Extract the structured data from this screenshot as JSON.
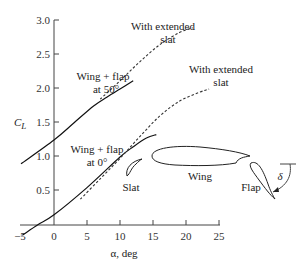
{
  "chart_data": {
    "type": "line",
    "title": "",
    "xlabel": "α, deg",
    "ylabel": "C_L",
    "xlim": [
      -5,
      25
    ],
    "ylim": [
      0,
      3.0
    ],
    "x_ticks": [
      -5,
      0,
      5,
      10,
      15,
      20,
      25
    ],
    "y_ticks": [
      0.5,
      1.0,
      1.5,
      2.0,
      2.5,
      3.0
    ],
    "x_tick_labels": [
      "−5",
      "0",
      "5",
      "10",
      "15",
      "20",
      "25"
    ],
    "y_tick_labels": [
      "0.5",
      "1.0",
      "1.5",
      "2.0",
      "2.5",
      "3.0"
    ],
    "grid": false,
    "series": [
      {
        "name": "Wing + flap at 0°",
        "style": "solid",
        "points": [
          [
            -4.8,
            -0.15
          ],
          [
            -2.5,
            0.0
          ],
          [
            0,
            0.15
          ],
          [
            5,
            0.55
          ],
          [
            10,
            1.0
          ],
          [
            12,
            1.15
          ],
          [
            14,
            1.28
          ],
          [
            15.5,
            1.33
          ]
        ]
      },
      {
        "name": "Wing + flap at 0°, with extended slat",
        "style": "dashed",
        "points": [
          [
            4,
            0.38
          ],
          [
            7,
            0.68
          ],
          [
            10,
            0.98
          ],
          [
            13,
            1.3
          ],
          [
            16,
            1.6
          ],
          [
            19,
            1.82
          ],
          [
            22,
            1.95
          ],
          [
            23.5,
            2.0
          ]
        ]
      },
      {
        "name": "Wing + flap at 50°",
        "style": "solid",
        "points": [
          [
            -5,
            0.9
          ],
          [
            0,
            1.25
          ],
          [
            3,
            1.5
          ],
          [
            6,
            1.75
          ],
          [
            8,
            1.88
          ],
          [
            10,
            2.0
          ],
          [
            12,
            2.12
          ]
        ]
      },
      {
        "name": "Wing + flap at 50°, with extended slat",
        "style": "dashed",
        "points": [
          [
            7,
            1.85
          ],
          [
            10,
            2.12
          ],
          [
            13,
            2.4
          ],
          [
            16,
            2.65
          ],
          [
            19,
            2.83
          ],
          [
            21,
            2.9
          ]
        ]
      }
    ],
    "annotations": [
      {
        "text": "With extended slat",
        "near": "upper dashed curve"
      },
      {
        "text": "Wing + flap at 50°",
        "near": "upper solid curve"
      },
      {
        "text": "With extended slat",
        "near": "lower dashed curve"
      },
      {
        "text": "Wing + flap at 0°",
        "near": "lower solid curve"
      },
      {
        "text": "Slat",
        "near": "airfoil sketch"
      },
      {
        "text": "Wing",
        "near": "airfoil sketch"
      },
      {
        "text": "Flap",
        "near": "airfoil sketch"
      },
      {
        "text": "δ",
        "near": "flap deflection angle"
      }
    ]
  },
  "labels": {
    "ylabel": "C",
    "ylabel_sub": "L",
    "xlabel": "α, deg",
    "slat_upper_1": "With extended",
    "slat_upper_2": "slat",
    "slat_lower_1": "With extended",
    "slat_lower_2": "slat",
    "flap50_1": "Wing + flap",
    "flap50_2": "at 50°",
    "flap0_1": "Wing + flap",
    "flap0_2": "at 0°",
    "sketch_slat": "Slat",
    "sketch_wing": "Wing",
    "sketch_flap": "Flap",
    "sketch_delta": "δ"
  }
}
